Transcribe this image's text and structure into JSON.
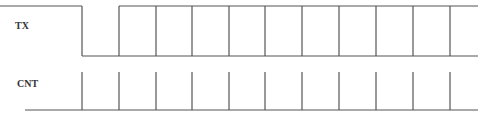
{
  "diagram": {
    "type": "timing-diagram",
    "signals": [
      {
        "name": "TX",
        "label": "TX",
        "high_y": 6,
        "low_y": 56,
        "initial_level": "high",
        "fall_x": 82,
        "rise_x": 119,
        "edges_x": [
          156,
          192,
          229,
          265,
          302,
          339,
          376,
          413,
          450
        ],
        "end_x": 478,
        "description": "High, then low (start bit), then bus shown as data cells with both rails"
      },
      {
        "name": "CNT",
        "label": "CNT",
        "baseline_y": 110,
        "tick_top_y": 72,
        "start_x": 25,
        "end_x": 478,
        "ticks_x": [
          82,
          119,
          156,
          192,
          229,
          265,
          302,
          339,
          376,
          413,
          450
        ]
      }
    ],
    "colors": {
      "line": "#555555",
      "text": "#333333",
      "background": "#ffffff"
    }
  }
}
